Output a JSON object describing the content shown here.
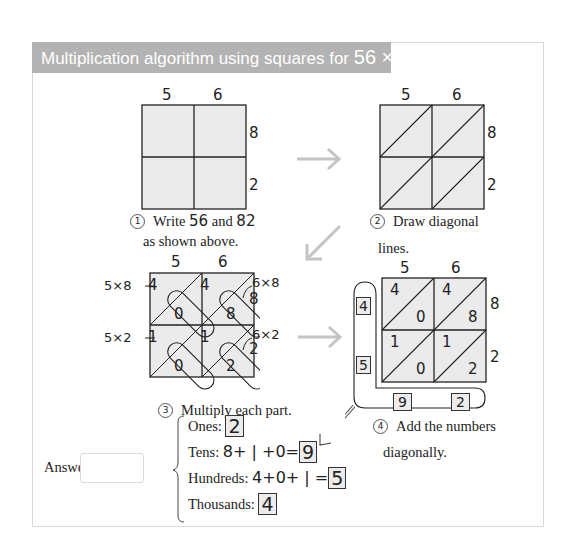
{
  "header": {
    "title": "Multiplication algorithm using squares for",
    "expression": "56 × 82"
  },
  "grid": {
    "top_digits": [
      "5",
      "6"
    ],
    "side_digits": [
      "8",
      "2"
    ]
  },
  "step1": {
    "number": "1",
    "text_a": "Write",
    "num_a": "56",
    "text_b": "and",
    "num_b": "82",
    "line2": "as shown above."
  },
  "step2": {
    "number": "2",
    "line1": "Draw diagonal",
    "line2": "lines."
  },
  "step3": {
    "number": "3",
    "text": "Multiply each part.",
    "labels": {
      "top_left": "5×8",
      "top_right": "6×8",
      "bottom_left": "5×2",
      "bottom_right": "6×2"
    },
    "cells": [
      {
        "tens": "4",
        "ones": "0"
      },
      {
        "tens": "4",
        "ones": "8"
      },
      {
        "tens": "1",
        "ones": "0"
      },
      {
        "tens": "1",
        "ones": "2"
      }
    ]
  },
  "step4": {
    "number": "4",
    "line1": "Add the numbers",
    "line2": "diagonally.",
    "left_boxes": [
      "4",
      "5"
    ],
    "bottom_boxes": [
      "9",
      "2"
    ]
  },
  "answer": {
    "label": "Answer:",
    "value": "",
    "rows": [
      {
        "label": "Ones:",
        "expr": "",
        "result": "2"
      },
      {
        "label": "Tens:",
        "expr": "8+ | +0=",
        "result": "9"
      },
      {
        "label": "Hundreds:",
        "expr": "4+0+ | =",
        "result": "5"
      },
      {
        "label": "Thousands:",
        "expr": "",
        "result": "4"
      }
    ]
  },
  "colors": {
    "header_bg": "#b3b3b3",
    "cell_fill": "#ebebeb",
    "arrow": "#c4c4c4"
  }
}
